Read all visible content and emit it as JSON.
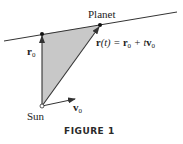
{
  "figure": {
    "caption": "FIGURE 1",
    "labels": {
      "planet": "Planet",
      "sun": "Sun",
      "r0_main": "r",
      "r0_sub": "0",
      "v0_main": "v",
      "v0_sub": "0",
      "equation": {
        "r": "r",
        "paren_t": "(t) = ",
        "r0": "r",
        "r0_sub": "0",
        "plus": " + t",
        "v0": "v",
        "v0_sub": "0"
      }
    },
    "colors": {
      "line": "#333333",
      "fill": "#c8c8c8",
      "text": "#222222"
    }
  }
}
